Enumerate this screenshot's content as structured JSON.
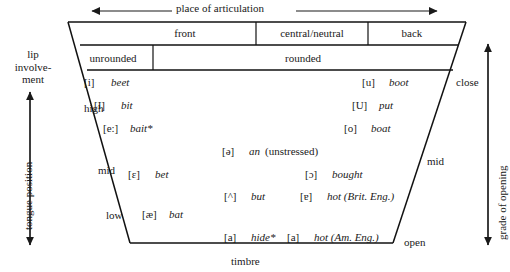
{
  "figure": {
    "top_axis_label": "place of articulation",
    "bottom_axis_label": "timbre",
    "left_axis_label": "tongue position",
    "right_axis_label": "grade of opening",
    "lip_involvement_label": "lip involve-\nment"
  },
  "lip_involvement": {
    "line1": "lip",
    "line2": "involve-",
    "line3": "ment"
  },
  "columns": {
    "place": [
      {
        "label": "front"
      },
      {
        "label": "central/neutral"
      },
      {
        "label": "back"
      }
    ],
    "rounding": [
      {
        "label": "unrounded"
      },
      {
        "label": "rounded"
      }
    ]
  },
  "tongue_zones": [
    {
      "label": "high"
    },
    {
      "label": "mid"
    },
    {
      "label": "low"
    }
  ],
  "opening_grades": [
    {
      "label": "close"
    },
    {
      "label": "mid"
    },
    {
      "label": "open"
    }
  ],
  "vowels": [
    {
      "symbol": "[i]",
      "word": "beet",
      "note": ""
    },
    {
      "symbol": "[I]",
      "word": "bit",
      "note": ""
    },
    {
      "symbol": "[e:]",
      "word": "bait*",
      "note": ""
    },
    {
      "symbol": "[u]",
      "word": "boot",
      "note": ""
    },
    {
      "symbol": "[U]",
      "word": "put",
      "note": ""
    },
    {
      "symbol": "[o]",
      "word": "boat",
      "note": ""
    },
    {
      "symbol": "[ə]",
      "word": "an",
      "note": "(unstressed)"
    },
    {
      "symbol": "[ɛ]",
      "word": "bet",
      "note": ""
    },
    {
      "symbol": "[ɔ]",
      "word": "bought",
      "note": ""
    },
    {
      "symbol": "[^]",
      "word": "but",
      "note": ""
    },
    {
      "symbol": "[ɐ]",
      "word": "hot (Brit. Eng.)",
      "note": ""
    },
    {
      "symbol": "[æ]",
      "word": "bat",
      "note": ""
    },
    {
      "symbol": "[a]",
      "word": "hide*",
      "note": ""
    },
    {
      "symbol": "[a]",
      "word": "hot (Am. Eng.)",
      "note": ""
    }
  ],
  "colors": {
    "ink": "#1a1a1a",
    "line": "#111111",
    "background": "#ffffff"
  }
}
